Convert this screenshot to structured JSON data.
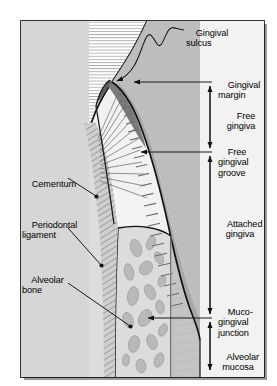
{
  "figure": {
    "frame": {
      "border_color": "#000000",
      "shadow_color": "#9a9a9a",
      "background_color": "#f2f2f2"
    },
    "palette": {
      "tooth_dentin": "#d6d6d6",
      "enamel_fill": "#ffffff",
      "enamel_hatch": "#8d8d8d",
      "free_gingiva_dark": "#7b7b7b",
      "attached_gingiva": "#a8a8a8",
      "alveolar_mucosa": "#c4c4c4",
      "bone_fill": "#dcdcdc",
      "trabecula": "#b4b4b4",
      "pdl_fiber": "#6f6f6f",
      "leader_line": "#1a1a1a",
      "text": "#000000"
    }
  },
  "labels": {
    "right": [
      {
        "id": "gingival-sulcus",
        "text": "Gingival\nsulcus",
        "x": 186,
        "y": 22
      },
      {
        "id": "gingival-margin",
        "text": "Gingival\nmargin",
        "x": 218,
        "y": 74
      },
      {
        "id": "free-gingiva",
        "text": "Free\ngingiva",
        "x": 215,
        "y": 104
      },
      {
        "id": "free-gingival-groove",
        "text": "Free\ngingival\ngroove",
        "x": 218,
        "y": 140
      },
      {
        "id": "attached-gingiva",
        "text": "Attached\ngingiva",
        "x": 213,
        "y": 212
      },
      {
        "id": "muco-gingival-junction",
        "text": "Muco-\ngingival\njunction",
        "x": 218,
        "y": 300
      },
      {
        "id": "alveolar-mucosa",
        "text": "Alveolar\nmucosa",
        "x": 213,
        "y": 345
      }
    ],
    "left": [
      {
        "id": "cementum",
        "text": "Cementum",
        "x": 22,
        "y": 172
      },
      {
        "id": "periodontal-ligament",
        "text": "Periodontal\nligament",
        "x": 22,
        "y": 213
      },
      {
        "id": "alveolar-bone",
        "text": "Alveolar\nbone",
        "x": 22,
        "y": 268
      }
    ]
  },
  "annotations": {
    "brackets": [
      {
        "id": "free-gingiva-bracket",
        "from_y": 82,
        "to_y": 152,
        "x": 210
      },
      {
        "id": "attached-gingiva-bracket",
        "from_y": 152,
        "to_y": 318,
        "x": 210
      },
      {
        "id": "alveolar-mucosa-bracket",
        "from_y": 318,
        "to_y": 374,
        "x": 210
      }
    ],
    "pointer_lines": [
      {
        "id": "gingival-margin-line",
        "y": 82,
        "from_x": 133,
        "to_x": 212
      },
      {
        "id": "free-gingival-groove-line",
        "y": 152,
        "from_x": 140,
        "to_x": 212
      },
      {
        "id": "mucogingival-junction-line",
        "y": 318,
        "from_x": 147,
        "to_x": 212
      }
    ]
  },
  "watermark": {
    "text": "",
    "visible": false
  }
}
